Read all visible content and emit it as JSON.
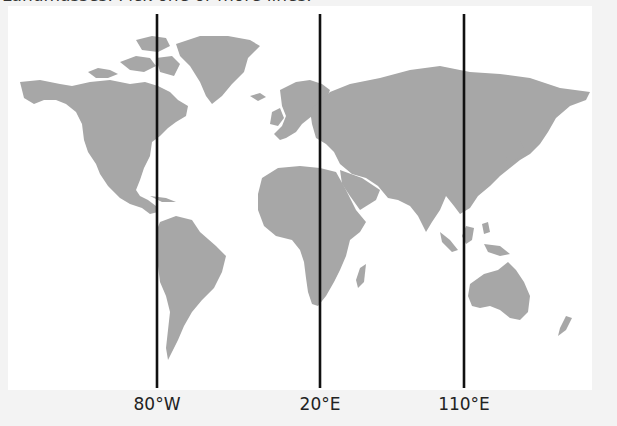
{
  "header": {
    "cut_text": "Landmasses. Pick one or more lines."
  },
  "map": {
    "land_color": "#a7a7a7",
    "line_color": "#111111",
    "background": "#ffffff",
    "meridians": [
      {
        "label": "80°W",
        "x": 157
      },
      {
        "label": "20°E",
        "x": 320
      },
      {
        "label": "110°E",
        "x": 464
      }
    ]
  }
}
